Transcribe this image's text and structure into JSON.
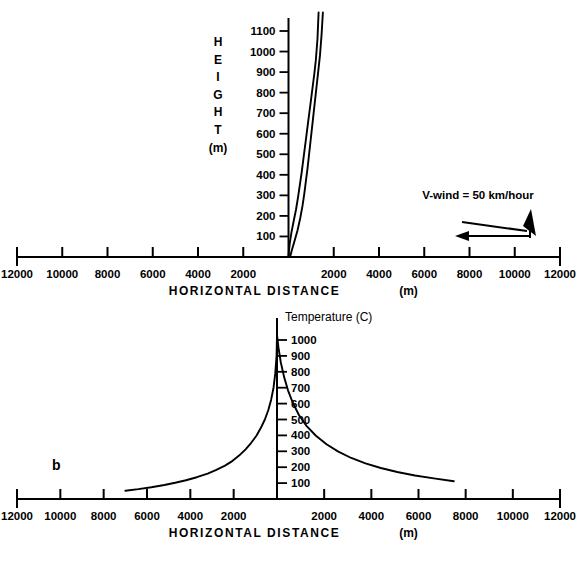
{
  "figure": {
    "panel_b_label": "b"
  },
  "chart_data": [
    {
      "id": "panel-a",
      "type": "line",
      "title": "",
      "subtitle": "",
      "xlabel": "HORIZONTAL DISTANCE",
      "xlabel_unit": "(m)",
      "ylabel_letters": [
        "H",
        "E",
        "I",
        "G",
        "H",
        "T"
      ],
      "ylabel_unit": "(m)",
      "xlim": [
        -12000,
        12000
      ],
      "ylim": [
        0,
        1200
      ],
      "grid": false,
      "legend_position": "none",
      "xticks": [
        -12000,
        -10000,
        -8000,
        -6000,
        -4000,
        -2000,
        0,
        2000,
        4000,
        6000,
        8000,
        10000,
        12000
      ],
      "xticklabels": [
        "12000",
        "10000",
        "8000",
        "6000",
        "4000",
        "2000",
        "",
        "2000",
        "4000",
        "6000",
        "8000",
        "10000",
        "12000"
      ],
      "yticks": [
        100,
        200,
        300,
        400,
        500,
        600,
        700,
        800,
        900,
        1000,
        1100
      ],
      "yticklabels": [
        "100",
        "200",
        "300",
        "400",
        "500",
        "600",
        "700",
        "800",
        "900",
        "1000",
        "1100"
      ],
      "annotations": [
        {
          "name": "wind-label",
          "text": "V-wind = 50 km/hour",
          "x": 6800,
          "y": 560
        }
      ],
      "series": [
        {
          "name": "plume-left-edge",
          "x": [
            0,
            20,
            60,
            130,
            230,
            330,
            420,
            500,
            580,
            650,
            720,
            790,
            860,
            930,
            1000,
            1070,
            1140,
            1210,
            1280,
            1330
          ],
          "y": [
            0,
            30,
            70,
            120,
            175,
            230,
            290,
            350,
            410,
            470,
            530,
            590,
            650,
            710,
            770,
            830,
            890,
            960,
            1060,
            1190
          ]
        },
        {
          "name": "plume-right-edge",
          "x": [
            70,
            140,
            260,
            400,
            520,
            620,
            700,
            770,
            840,
            900,
            960,
            1020,
            1080,
            1140,
            1200,
            1260,
            1320,
            1390,
            1460,
            1520
          ],
          "y": [
            0,
            30,
            75,
            130,
            190,
            250,
            310,
            370,
            430,
            490,
            550,
            610,
            670,
            730,
            790,
            850,
            910,
            980,
            1080,
            1190
          ]
        }
      ]
    },
    {
      "id": "panel-b",
      "type": "line",
      "title": "Temperature (C)",
      "subtitle": "",
      "xlabel": "HORIZONTAL DISTANCE",
      "xlabel_unit": "(m)",
      "ylabel": "Temperature",
      "ylabel_unit": "(C)",
      "xlim": [
        -12000,
        12000
      ],
      "ylim": [
        0,
        1100
      ],
      "grid": false,
      "legend_position": "none",
      "xticks": [
        -12000,
        -10000,
        -8000,
        -6000,
        -4000,
        -2000,
        0,
        2000,
        4000,
        6000,
        8000,
        10000,
        12000
      ],
      "xticklabels": [
        "12000",
        "10000",
        "8000",
        "6000",
        "4000",
        "2000",
        "",
        "2000",
        "4000",
        "6000",
        "8000",
        "10000",
        "12000"
      ],
      "yticks": [
        100,
        200,
        300,
        400,
        500,
        600,
        700,
        800,
        900,
        1000
      ],
      "yticklabels": [
        "100",
        "200",
        "300",
        "400",
        "500",
        "600",
        "700",
        "800",
        "900",
        "1000"
      ],
      "series": [
        {
          "name": "temperature-profile",
          "x": [
            -7000,
            -6400,
            -5800,
            -5200,
            -4700,
            -4200,
            -3700,
            -3200,
            -2800,
            -2400,
            -2050,
            -1750,
            -1450,
            -1200,
            -950,
            -750,
            -560,
            -400,
            -270,
            -160,
            -80,
            -20,
            0,
            60,
            160,
            300,
            470,
            680,
            930,
            1250,
            1650,
            2100,
            2600,
            3150,
            3750,
            4400,
            5100,
            5850,
            6650,
            7500
          ],
          "y": [
            52,
            62,
            74,
            88,
            102,
            118,
            137,
            160,
            183,
            210,
            240,
            273,
            312,
            352,
            398,
            446,
            500,
            560,
            625,
            700,
            790,
            900,
            1030,
            955,
            860,
            768,
            682,
            602,
            528,
            460,
            398,
            344,
            298,
            258,
            224,
            195,
            170,
            148,
            130,
            112
          ]
        }
      ]
    }
  ]
}
